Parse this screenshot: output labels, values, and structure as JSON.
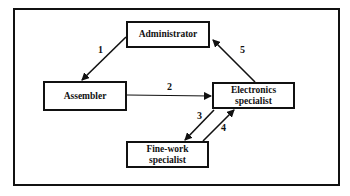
{
  "diagram": {
    "type": "flow",
    "nodes": [
      {
        "id": "administrator",
        "label": "Administrator"
      },
      {
        "id": "assembler",
        "label": "Assembler"
      },
      {
        "id": "electronics",
        "label_line1": "Electronics",
        "label_line2": "specialist"
      },
      {
        "id": "finework",
        "label_line1": "Fine-work",
        "label_line2": "specialist"
      }
    ],
    "edges": [
      {
        "from": "administrator",
        "to": "assembler",
        "label": "1"
      },
      {
        "from": "assembler",
        "to": "electronics",
        "label": "2"
      },
      {
        "from": "electronics",
        "to": "finework",
        "label": "3"
      },
      {
        "from": "finework",
        "to": "electronics",
        "label": "4"
      },
      {
        "from": "electronics",
        "to": "administrator",
        "label": "5"
      }
    ]
  }
}
